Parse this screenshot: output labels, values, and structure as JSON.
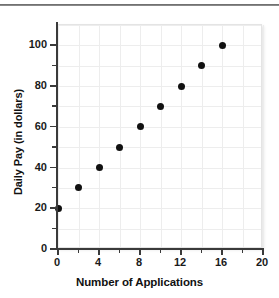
{
  "chart_data": {
    "type": "scatter",
    "title": "",
    "xlabel": "Number of Applications",
    "ylabel": "Daily Pay (in dollars)",
    "xlim": [
      0,
      20
    ],
    "ylim": [
      0,
      110
    ],
    "grid": true,
    "legend": false,
    "x_major_ticks": [
      0,
      4,
      8,
      12,
      16,
      20
    ],
    "x_minor_ticks": [
      2,
      6,
      10,
      14,
      18
    ],
    "y_major_ticks": [
      0,
      20,
      40,
      60,
      80,
      100
    ],
    "y_minor_ticks": [
      10,
      30,
      50,
      70,
      90
    ],
    "x_tick_labels": [
      "0",
      "4",
      "8",
      "12",
      "16",
      "20"
    ],
    "y_tick_labels": [
      "0",
      "20",
      "40",
      "60",
      "80",
      "100"
    ],
    "marker": "filled-circle",
    "marker_color": "#111111",
    "grid_color": "#ededed",
    "axis_color": "#3a3a3a",
    "x": [
      0,
      2,
      4,
      6,
      8,
      10,
      12,
      14,
      16
    ],
    "y": [
      20,
      30,
      40,
      50,
      60,
      70,
      80,
      90,
      100
    ],
    "points": [
      {
        "x": 0,
        "y": 20
      },
      {
        "x": 2,
        "y": 30
      },
      {
        "x": 4,
        "y": 40
      },
      {
        "x": 6,
        "y": 50
      },
      {
        "x": 8,
        "y": 60
      },
      {
        "x": 10,
        "y": 70
      },
      {
        "x": 12,
        "y": 80
      },
      {
        "x": 14,
        "y": 90
      },
      {
        "x": 16,
        "y": 100
      }
    ]
  }
}
